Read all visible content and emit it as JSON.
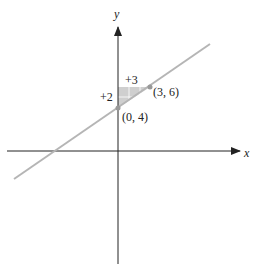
{
  "diagram": {
    "axes": {
      "x_label": "x",
      "y_label": "y"
    },
    "line": {
      "slope": "2/3",
      "y_intercept": 4
    },
    "points": [
      {
        "label": "(0, 4)",
        "x": 0,
        "y": 4
      },
      {
        "label": "(3, 6)",
        "x": 3,
        "y": 6
      }
    ],
    "rise_label": "+2",
    "run_label": "+3",
    "colors": {
      "line": "#b5b5b5",
      "axis": "#222222",
      "triangle": "#cfcfcf",
      "point": "#999999"
    }
  }
}
